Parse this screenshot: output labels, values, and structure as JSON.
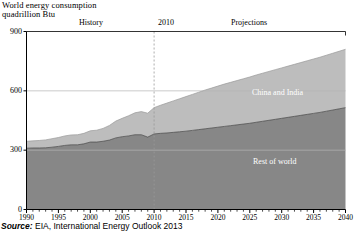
{
  "title": {
    "line1": "World energy consumption",
    "line2": "quadrillion Btu"
  },
  "annotations": {
    "history": "History",
    "divider_year": "2010",
    "projections": "Projections"
  },
  "source": {
    "prefix": "Source:",
    "text": " EIA, International Energy Outlook 2013"
  },
  "colors": {
    "rest_of_world": "#878787",
    "china_and_india": "#bdbdbd",
    "axis": "#000000",
    "gridline": "#b4b4b4",
    "divider": "#9a9a9a",
    "series_label_text": "#ffffff"
  },
  "chart_data": {
    "type": "area",
    "stacked": true,
    "title": "World energy consumption",
    "subtitle": "quadrillion Btu",
    "xlabel": "",
    "ylabel": "quadrillion Btu",
    "xlim": [
      1990,
      2040
    ],
    "ylim": [
      0,
      900
    ],
    "yticks": [
      0,
      300,
      600,
      900
    ],
    "ytick_labels": [
      "0",
      "300",
      "600",
      "900"
    ],
    "xticks": [
      1990,
      1995,
      2000,
      2005,
      2010,
      2015,
      2020,
      2025,
      2030,
      2035,
      2040
    ],
    "xtick_labels": [
      "1990",
      "1995",
      "2000",
      "2005",
      "2010",
      "2015",
      "2020",
      "2025",
      "2030",
      "2035",
      "2040"
    ],
    "minor_xtick_interval": 1,
    "grid": "horizontal-at-300-600",
    "legend": "inline-labels",
    "divider_x": 2010,
    "divider_style": "dashed",
    "x": [
      1990,
      1991,
      1992,
      1993,
      1994,
      1995,
      1996,
      1997,
      1998,
      1999,
      2000,
      2001,
      2002,
      2003,
      2004,
      2005,
      2006,
      2007,
      2008,
      2009,
      2010,
      2011,
      2012,
      2013,
      2014,
      2015,
      2016,
      2017,
      2018,
      2019,
      2020,
      2021,
      2022,
      2023,
      2024,
      2025,
      2026,
      2027,
      2028,
      2029,
      2030,
      2031,
      2032,
      2033,
      2034,
      2035,
      2036,
      2037,
      2038,
      2039,
      2040
    ],
    "series": [
      {
        "name": "Rest of world",
        "values": [
          310,
          311,
          311,
          312,
          315,
          319,
          324,
          327,
          327,
          332,
          341,
          341,
          345,
          351,
          362,
          368,
          372,
          378,
          378,
          366,
          382,
          385,
          387,
          390,
          393,
          396,
          400,
          404,
          408,
          412,
          416,
          420,
          424,
          428,
          432,
          436,
          441,
          446,
          451,
          456,
          461,
          466,
          471,
          476,
          481,
          486,
          491,
          497,
          503,
          509,
          515
        ]
      },
      {
        "name": "China and India",
        "values": [
          35,
          36,
          38,
          40,
          43,
          45,
          48,
          50,
          51,
          53,
          57,
          60,
          65,
          74,
          85,
          93,
          102,
          111,
          117,
          121,
          133,
          142,
          151,
          159,
          167,
          175,
          182,
          189,
          196,
          202,
          208,
          214,
          219,
          224,
          229,
          234,
          239,
          243,
          247,
          251,
          255,
          259,
          263,
          267,
          271,
          275,
          279,
          283,
          287,
          291,
          295
        ]
      }
    ],
    "totals": [
      345,
      347,
      349,
      352,
      358,
      364,
      372,
      377,
      378,
      385,
      398,
      401,
      410,
      425,
      447,
      461,
      474,
      489,
      495,
      487,
      515,
      527,
      538,
      549,
      560,
      571,
      582,
      593,
      604,
      614,
      624,
      634,
      643,
      652,
      661,
      670,
      680,
      689,
      698,
      707,
      716,
      725,
      734,
      743,
      752,
      761,
      770,
      780,
      790,
      800,
      810
    ]
  }
}
